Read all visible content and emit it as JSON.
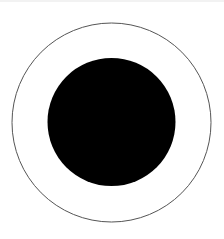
{
  "figure": {
    "icon": "radio-selected-icon",
    "outer_ring": {
      "cx": 111.5,
      "cy": 122.5,
      "r": 99.5,
      "stroke": "#555555",
      "stroke_width": 1,
      "fill": "#ffffff"
    },
    "inner_dot": {
      "cx": 111.5,
      "cy": 122,
      "r": 64,
      "fill": "#000000"
    }
  },
  "colors": {
    "background": "#ffffff",
    "top_border": "#f2f2f2"
  }
}
